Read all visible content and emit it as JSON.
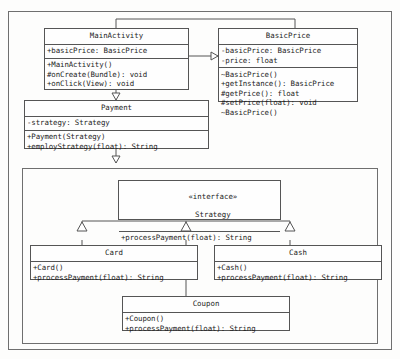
{
  "diagram": {
    "classes": {
      "main_activity": {
        "name": "MainActivity",
        "attributes": [
          "+basicPrice: BasicPrice"
        ],
        "operations": [
          "+MainActivity()",
          "#onCreate(Bundle): void",
          "+onClick(View): void"
        ]
      },
      "basic_price": {
        "name": "BasicPrice",
        "attributes": [
          "-basicPrice: BasicPrice",
          "-price: float"
        ],
        "operations": [
          "~BasicPrice()",
          "+getInstance(): BasicPrice",
          "#getPrice(): float",
          "#setPrice(float): void",
          "~BasicPrice()"
        ]
      },
      "payment": {
        "name": "Payment",
        "attributes": [
          "-strategy: Strategy"
        ],
        "operations": [
          "+Payment(Strategy)",
          "+employStrategy(float): String"
        ]
      },
      "strategy": {
        "stereotype": "«interface»",
        "name": "Strategy",
        "operations": [
          "+processPayment(float): String"
        ]
      },
      "card": {
        "name": "Card",
        "operations": [
          "+Card()",
          "+processPayment(float): String"
        ]
      },
      "cash": {
        "name": "Cash",
        "operations": [
          "+Cash()",
          "+processPayment(float): String"
        ]
      },
      "coupon": {
        "name": "Coupon",
        "operations": [
          "+Coupon()",
          "+processPayment(float): String"
        ]
      }
    },
    "colors": {
      "stroke": "#555555",
      "package_stroke": "#6f6f6f",
      "text": "#1d1d1d",
      "background": "#fdfdfc"
    }
  }
}
